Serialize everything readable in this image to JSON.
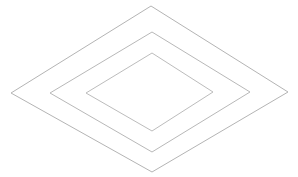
{
  "figure": {
    "background_color": "#ffffff",
    "width": 298,
    "height": 177
  },
  "chart_data": {
    "type": "scatter",
    "title": "",
    "subtitle": "",
    "xlabel": "",
    "ylabel": "",
    "grid": false,
    "legend": null,
    "axis_visible": false,
    "tick_labels": [],
    "annotations": [],
    "center": [
      150,
      92
    ],
    "shapes": [
      {
        "name": "outer-diamond",
        "stroke": "#b4b4b4",
        "stroke_width": 1,
        "fill": "none",
        "vertices": [
          [
            151,
            6
          ],
          [
            288,
            92
          ],
          [
            152,
            172
          ],
          [
            11,
            93
          ]
        ],
        "half_width": 138,
        "half_height": 83
      },
      {
        "name": "middle-diamond",
        "stroke": "#b8b8b8",
        "stroke_width": 1,
        "fill": "none",
        "vertices": [
          [
            152,
            32
          ],
          [
            250,
            92
          ],
          [
            152,
            152
          ],
          [
            50,
            93
          ]
        ],
        "half_width": 100,
        "half_height": 60
      },
      {
        "name": "inner-diamond",
        "stroke": "#bcbcbc",
        "stroke_width": 1,
        "fill": "none",
        "vertices": [
          [
            152,
            53
          ],
          [
            213,
            92
          ],
          [
            152,
            131
          ],
          [
            86,
            93
          ]
        ],
        "half_width": 63,
        "half_height": 39
      }
    ]
  }
}
